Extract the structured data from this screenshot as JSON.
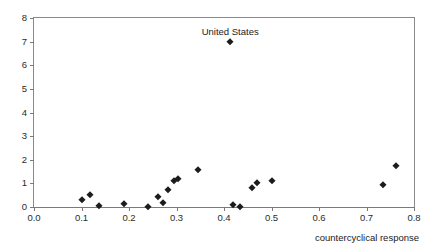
{
  "figure": {
    "title_fragment": "",
    "background": "#ffffff",
    "marker_color": "#1c1c1c",
    "axis_color": "#7a7a7a"
  },
  "chart_data": {
    "type": "scatter",
    "title": "",
    "xlabel": "countercyclical response",
    "ylabel": "",
    "xlim": [
      0.0,
      0.8
    ],
    "ylim": [
      0,
      8
    ],
    "xticks": [
      "0.0",
      "0.1",
      "0.2",
      "0.3",
      "0.4",
      "0.5",
      "0.6",
      "0.7",
      "0.8"
    ],
    "xtick_values": [
      0.0,
      0.1,
      0.2,
      0.3,
      0.4,
      0.5,
      0.6,
      0.7,
      0.8
    ],
    "yticks": [
      "0",
      "1",
      "2",
      "3",
      "4",
      "5",
      "6",
      "7",
      "8"
    ],
    "ytick_values": [
      0,
      1,
      2,
      3,
      4,
      5,
      6,
      7,
      8
    ],
    "grid": false,
    "legend": null,
    "marker": "diamond",
    "points": [
      {
        "x": 0.1,
        "y": 0.3,
        "label": null
      },
      {
        "x": 0.117,
        "y": 0.52,
        "label": null
      },
      {
        "x": 0.137,
        "y": 0.05,
        "label": null
      },
      {
        "x": 0.19,
        "y": 0.12,
        "label": null
      },
      {
        "x": 0.24,
        "y": 0.02,
        "label": null
      },
      {
        "x": 0.262,
        "y": 0.42,
        "label": null
      },
      {
        "x": 0.272,
        "y": 0.18,
        "label": null
      },
      {
        "x": 0.282,
        "y": 0.72,
        "label": null
      },
      {
        "x": 0.295,
        "y": 1.1,
        "label": null
      },
      {
        "x": 0.303,
        "y": 1.18,
        "label": null
      },
      {
        "x": 0.345,
        "y": 1.55,
        "label": null
      },
      {
        "x": 0.413,
        "y": 7.0,
        "label": "United States"
      },
      {
        "x": 0.418,
        "y": 0.08,
        "label": null
      },
      {
        "x": 0.433,
        "y": 0.02,
        "label": null
      },
      {
        "x": 0.458,
        "y": 0.8,
        "label": null
      },
      {
        "x": 0.47,
        "y": 1.02,
        "label": null
      },
      {
        "x": 0.5,
        "y": 1.12,
        "label": null
      },
      {
        "x": 0.735,
        "y": 0.95,
        "label": null
      },
      {
        "x": 0.762,
        "y": 1.75,
        "label": null
      }
    ],
    "annotations": [
      {
        "text": "United States",
        "x": 0.413,
        "y": 7.0
      }
    ]
  }
}
